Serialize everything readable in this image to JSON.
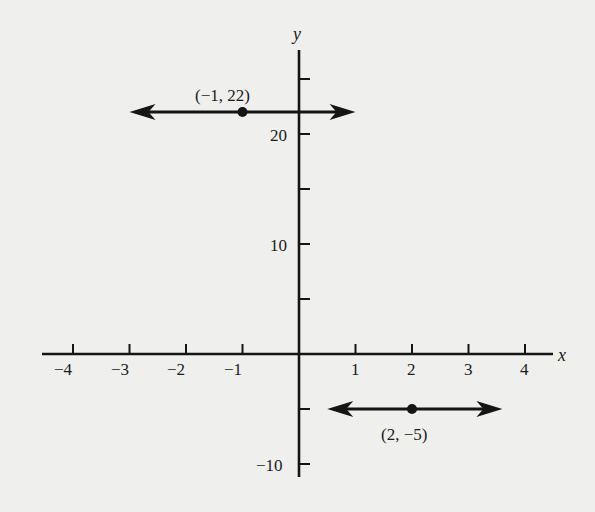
{
  "chart_data": {
    "type": "line",
    "title": "",
    "xlabel": "x",
    "ylabel": "y",
    "xlim": [
      -4.5,
      4.6
    ],
    "ylim": [
      -11,
      27
    ],
    "grid": false,
    "x_ticks": [
      -4,
      -3,
      -2,
      -1,
      1,
      2,
      3,
      4
    ],
    "x_tick_labels": [
      "−4",
      "−3",
      "−2",
      "−1",
      "1",
      "2",
      "3",
      "4"
    ],
    "y_ticks": [
      -10,
      -5,
      5,
      10,
      15,
      20,
      25
    ],
    "y_tick_labels": {
      "-10": "−10",
      "10": "10",
      "20": "20"
    },
    "series": [
      {
        "name": "horizontal line y = 22",
        "y": 22,
        "x_range": [
          -3.0,
          1.0
        ],
        "arrows": "both",
        "point": {
          "x": -1,
          "y": 22,
          "label": "(−1, 22)"
        }
      },
      {
        "name": "horizontal line y = -5",
        "y": -5,
        "x_range": [
          0.5,
          3.6
        ],
        "arrows": "both",
        "point": {
          "x": 2,
          "y": -5,
          "label": "(2, −5)"
        }
      }
    ]
  },
  "labels": {
    "x_axis": "x",
    "y_axis": "y",
    "point1": "(−1, 22)",
    "point2": "(2, −5)",
    "xt": [
      "−4",
      "−3",
      "−2",
      "−1",
      "1",
      "2",
      "3",
      "4"
    ],
    "yt": {
      "p20": "20",
      "p10": "10",
      "m10": "−10"
    }
  }
}
